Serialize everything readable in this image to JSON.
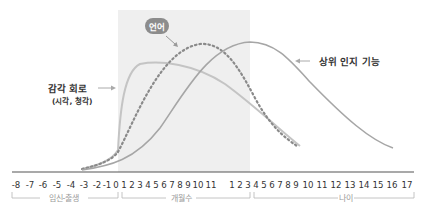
{
  "chart_data": {
    "type": "line",
    "title": "",
    "xlabel": "",
    "ylabel": "",
    "grid": false,
    "shaded_region": {
      "from": "0 months",
      "to": "11 months",
      "color": "#efefef"
    },
    "x_tick_labels": {
      "gestation": [
        "-8",
        "-7",
        "-6",
        "-5",
        "-4",
        "-3",
        "-2",
        "-1",
        "0"
      ],
      "months": [
        "1",
        "2",
        "3",
        "4",
        "5",
        "6",
        "7",
        "8",
        "9",
        "10",
        "11"
      ],
      "years": [
        "1",
        "2",
        "3",
        "4",
        "5",
        "6",
        "7",
        "8",
        "9",
        "10",
        "11",
        "12",
        "13",
        "14",
        "15",
        "16",
        "17"
      ]
    },
    "x_groups": [
      {
        "label": "임신-출생",
        "range": "-8 to 0"
      },
      {
        "label": "개월수",
        "range": "0 to 11 months"
      },
      {
        "label": "나이",
        "range": "1 to 17 years"
      }
    ],
    "series": [
      {
        "name": "감각 회로",
        "sublabel": "(시각, 청각)",
        "style": "solid",
        "color": "#c4c4c4",
        "description": "Steep rise at birth, peaks ~2-4 months, declines until ~8 years",
        "points": [
          [
            "-3",
            0.02
          ],
          [
            "0",
            0.12
          ],
          [
            "1m",
            0.75
          ],
          [
            "3m",
            0.85
          ],
          [
            "6m",
            0.84
          ],
          [
            "9m",
            0.8
          ],
          [
            "1y",
            0.74
          ],
          [
            "3y",
            0.5
          ],
          [
            "6y",
            0.25
          ],
          [
            "8y",
            0.1
          ]
        ]
      },
      {
        "name": "언어",
        "style": "dotted",
        "color": "#8a8a8a",
        "description": "Rises from before birth, peaks ~9 months, declines until ~8 years",
        "points": [
          [
            "-3",
            0.02
          ],
          [
            "0",
            0.12
          ],
          [
            "3m",
            0.55
          ],
          [
            "6m",
            0.85
          ],
          [
            "9m",
            0.95
          ],
          [
            "11m",
            0.92
          ],
          [
            "2y",
            0.75
          ],
          [
            "4y",
            0.45
          ],
          [
            "6y",
            0.25
          ],
          [
            "8y",
            0.12
          ]
        ]
      },
      {
        "name": "상위 인지 기능",
        "style": "solid",
        "color": "#a6a6a6",
        "description": "Gradual rise, peaks ~2-3 years, declines until ~16 years",
        "points": [
          [
            "-3",
            0.0
          ],
          [
            "0",
            0.1
          ],
          [
            "6m",
            0.4
          ],
          [
            "11m",
            0.75
          ],
          [
            "2y",
            0.97
          ],
          [
            "3y",
            0.98
          ],
          [
            "5y",
            0.88
          ],
          [
            "8y",
            0.62
          ],
          [
            "12y",
            0.3
          ],
          [
            "16y",
            0.1
          ]
        ]
      }
    ],
    "annotations": [
      {
        "text": "감각 회로",
        "sub": "(시각, 청각)",
        "arrow": "right"
      },
      {
        "text": "언어",
        "style": "pill",
        "arrow": "down-right"
      },
      {
        "text": "상위 인지 기능",
        "arrow": "left"
      }
    ]
  },
  "labels": {
    "sensory": "감각 회로",
    "sensory_sub": "(시각, 청각)",
    "language": "언어",
    "higher": "상위 인지 기능",
    "group_gestation": "임신-출생",
    "group_months": "개월수",
    "group_years": "나이"
  },
  "colors": {
    "shade": "#efefef",
    "sensory": "#c4c4c4",
    "language": "#8a8a8a",
    "higher": "#a6a6a6",
    "pill": "#8c8c8c",
    "axis": "#555555"
  }
}
